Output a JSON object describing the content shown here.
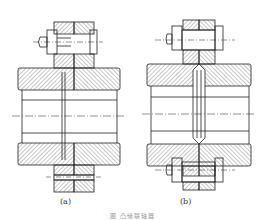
{
  "figure": {
    "caption": "图     凸缘联轴器",
    "subfigures": [
      {
        "label": "(a)",
        "description": "Flanged coupling with centering by recess/spigot and through-bolt connection (bolt above axis)"
      },
      {
        "label": "(b)",
        "description": "Flanged coupling with centering by split ring, reamed bolt connection (bolts above and below axis)"
      }
    ]
  },
  "colors": {
    "line": "#222222",
    "hatch": "#444444",
    "background": "#ffffff"
  }
}
